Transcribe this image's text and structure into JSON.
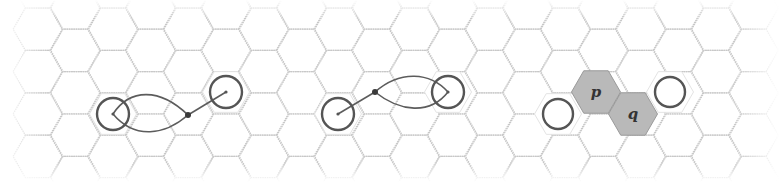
{
  "diagram": {
    "type": "hexagonal-grid-illustration",
    "grid": {
      "orientation": "flat-top",
      "hex_side_px": 24.5,
      "origin_center": [
        113,
        114
      ],
      "col_step_px": 37.7,
      "row_step_px": 42.4,
      "x_range": [
        30,
        750
      ],
      "y_range": [
        8,
        176
      ],
      "line_color": "#c8c8c8"
    },
    "panels": [
      {
        "id": "panel-1",
        "description": "Two circled hex cells joined by a path that loops around the left cell and meets at a junction dot",
        "circles": [
          {
            "cx": 113,
            "cy": 114,
            "r": 16
          },
          {
            "cx": 226,
            "cy": 92,
            "r": 16
          }
        ],
        "junction": {
          "cx": 188,
          "cy": 115
        },
        "paths": [
          "M 188 115 C 160 88, 130 88, 113 114",
          "M 113 114 C 135 140, 165 135, 188 115",
          "M 188 115 L 226 92"
        ]
      },
      {
        "id": "panel-2",
        "description": "Mirror arrangement: path loops around the right circled cell and meets a junction dot near the left",
        "circles": [
          {
            "cx": 338,
            "cy": 114,
            "r": 16
          },
          {
            "cx": 448,
            "cy": 92,
            "r": 16
          }
        ],
        "junction": {
          "cx": 375,
          "cy": 92
        },
        "paths": [
          "M 338 114 L 375 92",
          "M 375 92 C 400 70, 430 72, 448 92",
          "M 448 92 C 430 115, 400 112, 375 92"
        ]
      },
      {
        "id": "panel-3",
        "description": "Two circled cells with two shaded cells p and q between them",
        "circles": [
          {
            "cx": 558,
            "cy": 114,
            "r": 15
          },
          {
            "cx": 670,
            "cy": 92,
            "r": 15
          }
        ],
        "shaded_hexes": [
          {
            "label": "p",
            "cx": 596,
            "cy": 92
          },
          {
            "label": "q",
            "cx": 633,
            "cy": 114
          }
        ],
        "color": "#b9b9b9"
      }
    ],
    "labels": {
      "p": "p",
      "q": "q"
    }
  }
}
